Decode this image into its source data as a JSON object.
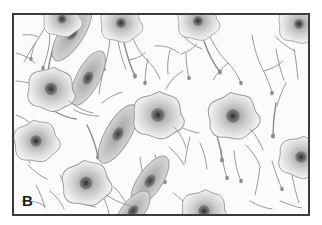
{
  "figure": {
    "panel_label": "B",
    "caption_text": "",
    "kind": "histology-illustration"
  },
  "colors": {
    "page_background": "#ffffff",
    "panel_background": "#fbfbfb",
    "frame_border": "#3c3c3c",
    "process_stroke": "#8a8a8a",
    "soma_outline": "#9a9a9a",
    "soma_fill_outer": "#e6e6e6",
    "soma_fill_mid": "#c8c8c8",
    "soma_fill_inner": "#9e9e9e",
    "nucleus": "#5e5e5e",
    "nucleolus": "#3a3a3a",
    "spindle_fill": "#bdbdbd",
    "label_color": "#1d1d1d"
  },
  "frame": {
    "x": 12,
    "y": 13,
    "width": 298,
    "height": 203,
    "border_width": 2
  },
  "cells": {
    "stellate_count": 10,
    "spindle_count": 5,
    "stellate": [
      {
        "name": "stellate-top-left-clipped",
        "cx": 48,
        "cy": 6,
        "r": 17
      },
      {
        "name": "stellate-top-mid",
        "cx": 107,
        "cy": 10,
        "r": 18
      },
      {
        "name": "stellate-top-right",
        "cx": 183,
        "cy": 8,
        "r": 18
      },
      {
        "name": "stellate-top-far-right",
        "cx": 284,
        "cy": 12,
        "r": 18
      },
      {
        "name": "stellate-left-upper",
        "cx": 38,
        "cy": 74,
        "r": 21
      },
      {
        "name": "stellate-left-lower",
        "cx": 23,
        "cy": 124,
        "r": 20
      },
      {
        "name": "stellate-center",
        "cx": 143,
        "cy": 100,
        "r": 22
      },
      {
        "name": "stellate-right-center",
        "cx": 218,
        "cy": 101,
        "r": 22
      },
      {
        "name": "stellate-right-low",
        "cx": 285,
        "cy": 141,
        "r": 20
      },
      {
        "name": "stellate-bottom-left",
        "cx": 73,
        "cy": 167,
        "r": 21
      },
      {
        "name": "stellate-bottom-mid",
        "cx": 190,
        "cy": 196,
        "r": 20
      }
    ],
    "spindle": [
      {
        "name": "spindle-chain-1",
        "cx": 58,
        "cy": 18,
        "angle": -58
      },
      {
        "name": "spindle-chain-2",
        "cx": 72,
        "cy": 62,
        "angle": -62
      },
      {
        "name": "spindle-chain-3",
        "cx": 103,
        "cy": 118,
        "angle": -60
      },
      {
        "name": "spindle-chain-4",
        "cx": 133,
        "cy": 165,
        "angle": -58
      },
      {
        "name": "spindle-lower-left",
        "cx": 118,
        "cy": 198,
        "angle": -55
      }
    ]
  }
}
